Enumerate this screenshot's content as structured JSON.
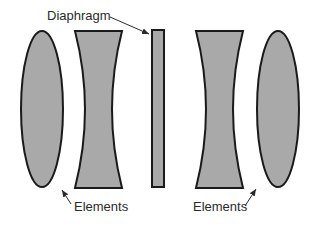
{
  "diagram": {
    "labels": {
      "diaphragm": "Diaphragm",
      "elements_left": "Elements",
      "elements_right": "Elements"
    },
    "colors": {
      "fill": "#a9a9a9",
      "stroke": "#1a1a1a",
      "text": "#2a2a2a",
      "background": "#ffffff"
    },
    "components": [
      {
        "name": "left-convex-element",
        "type": "biconvex-lens"
      },
      {
        "name": "left-concave-element",
        "type": "biconcave-lens"
      },
      {
        "name": "diaphragm",
        "type": "aperture-stop"
      },
      {
        "name": "right-concave-element",
        "type": "biconcave-lens"
      },
      {
        "name": "right-convex-element",
        "type": "biconvex-lens"
      }
    ]
  }
}
